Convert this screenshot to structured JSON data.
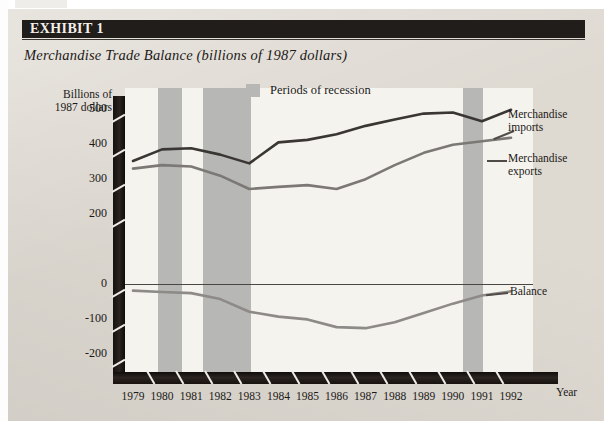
{
  "exhibit": {
    "banner_label": "EXHIBIT",
    "banner_number": "1",
    "subtitle": "Merchandise Trade Balance (billions of 1987 dollars)"
  },
  "legend": {
    "recession_label": "Periods of recession",
    "recession_color": "#b7b7b5"
  },
  "annotations": {
    "imports_line1": "Merchandise",
    "imports_line2": "imports",
    "exports_line1": "Merchandise",
    "exports_line2": "exports",
    "balance": "Balance"
  },
  "axes": {
    "y_caption_line1": "Billions of",
    "y_caption_line2": "1987 dollars",
    "x_caption": "Year"
  },
  "chart_data": {
    "type": "line",
    "title": "Merchandise Trade Balance (billions of 1987 dollars)",
    "xlabel": "Year",
    "ylabel": "Billions of 1987 dollars",
    "x": [
      1979,
      1980,
      1981,
      1982,
      1983,
      1984,
      1985,
      1986,
      1987,
      1988,
      1989,
      1990,
      1991,
      1992
    ],
    "xtick_labels": [
      "1979",
      "1980",
      "1981",
      "1982",
      "1983",
      "1984",
      "1985",
      "1986",
      "1987",
      "1988",
      "1989",
      "1990",
      "1991",
      "1992"
    ],
    "ytick_labels": [
      "500",
      "400",
      "300",
      "200",
      "0",
      "-100",
      "-200"
    ],
    "ytick_values": [
      500,
      400,
      300,
      200,
      0,
      -100,
      -200
    ],
    "ylim": [
      -250,
      560
    ],
    "grid": false,
    "legend_position": "inside-top-center",
    "series": [
      {
        "name": "Merchandise imports",
        "color": "#3a3633",
        "width": 2.6,
        "values": [
          352,
          385,
          388,
          370,
          345,
          405,
          412,
          428,
          452,
          470,
          487,
          490,
          465,
          498
        ]
      },
      {
        "name": "Merchandise exports",
        "color": "#7b7875",
        "width": 2.6,
        "values": [
          330,
          340,
          336,
          310,
          272,
          278,
          283,
          272,
          300,
          340,
          375,
          398,
          408,
          418
        ]
      },
      {
        "name": "Balance",
        "color": "#8d8a87",
        "width": 2.6,
        "values": [
          -18,
          -22,
          -25,
          -42,
          -78,
          -92,
          -100,
          -122,
          -125,
          -108,
          -82,
          -55,
          -32,
          -20
        ]
      }
    ],
    "recession_bands": [
      {
        "start": 1979.85,
        "end": 1980.7
      },
      {
        "start": 1981.4,
        "end": 1983.05
      },
      {
        "start": 1990.35,
        "end": 1991.05
      }
    ],
    "zero_line": 0
  }
}
